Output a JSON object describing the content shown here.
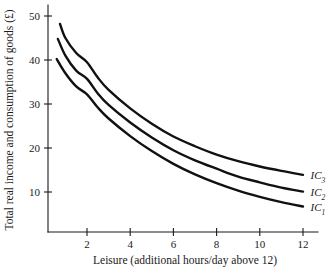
{
  "chart_data": {
    "type": "line",
    "title": "",
    "xlabel": "Leisure (additional hours/day above 12)",
    "ylabel": "Total real income and consumption of goods (£)",
    "xlim": [
      0,
      12.8
    ],
    "ylim": [
      0,
      52
    ],
    "xticks": [
      2,
      4,
      6,
      8,
      10,
      12
    ],
    "yticks": [
      10,
      20,
      30,
      40,
      50
    ],
    "xtick_labels": [
      "2",
      "4",
      "6",
      "8",
      "10",
      "12"
    ],
    "ytick_labels": [
      "10",
      "20",
      "30",
      "40",
      "50"
    ],
    "grid": false,
    "legend_position": "right-inline",
    "series": [
      {
        "name": "IC3",
        "label": "IC",
        "subscript": "3",
        "color": "#111111",
        "x": [
          0.75,
          1.0,
          1.5,
          2.0,
          2.5,
          3.0,
          4.0,
          5.0,
          6.0,
          7.0,
          8.0,
          9.0,
          10.0,
          11.0,
          12.0
        ],
        "y": [
          48.2,
          45.0,
          41.6,
          39.5,
          36.0,
          33.2,
          29.0,
          25.5,
          22.6,
          20.4,
          18.5,
          17.0,
          15.8,
          14.8,
          13.9
        ]
      },
      {
        "name": "IC2",
        "label": "IC",
        "subscript": "2",
        "color": "#111111",
        "x": [
          0.65,
          1.0,
          1.5,
          2.0,
          2.5,
          3.0,
          4.0,
          5.0,
          6.0,
          7.0,
          8.0,
          9.0,
          10.0,
          11.0,
          12.0
        ],
        "y": [
          44.8,
          41.0,
          37.6,
          35.7,
          32.4,
          29.8,
          25.8,
          22.4,
          19.5,
          17.2,
          15.3,
          13.5,
          12.2,
          11.0,
          10.1
        ]
      },
      {
        "name": "IC1",
        "label": "IC",
        "subscript": "1",
        "color": "#111111",
        "x": [
          0.6,
          1.0,
          1.5,
          2.0,
          2.5,
          3.0,
          4.0,
          5.0,
          6.0,
          7.0,
          8.0,
          9.0,
          10.0,
          11.0,
          12.0
        ],
        "y": [
          40.2,
          37.0,
          34.0,
          32.2,
          29.2,
          26.7,
          22.7,
          19.3,
          16.4,
          14.0,
          12.0,
          10.3,
          8.9,
          7.7,
          6.7
        ]
      }
    ],
    "annotations": [
      {
        "name": "ic3-label",
        "text": "IC",
        "sub": "3",
        "x": 12.35,
        "y": 13.9
      },
      {
        "name": "ic2-label",
        "text": "IC",
        "sub": "2",
        "x": 12.35,
        "y": 10.1
      },
      {
        "name": "ic1-label",
        "text": "IC",
        "sub": "1",
        "x": 12.35,
        "y": 6.7
      }
    ]
  }
}
